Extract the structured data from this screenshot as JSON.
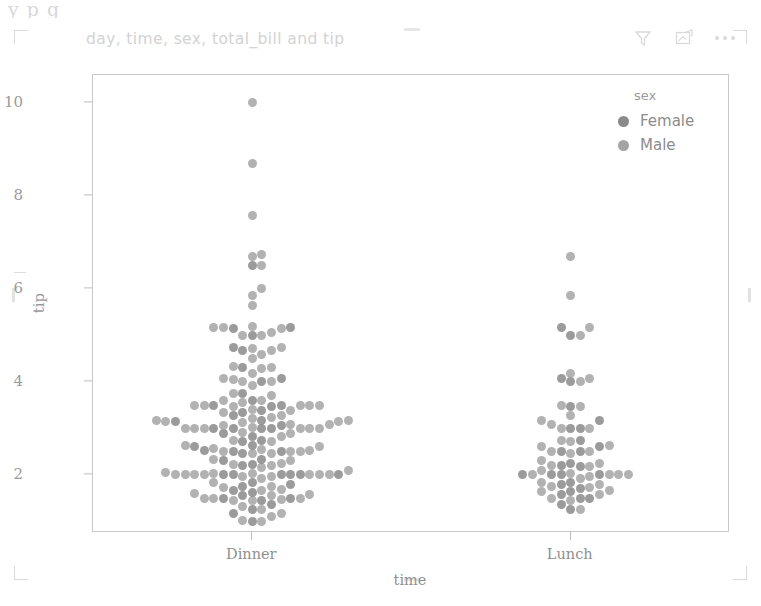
{
  "window": {
    "ghost_top_text": "y                    p      g",
    "background": "#ffffff"
  },
  "header": {
    "title": "day, time, sex, total_bill and tip",
    "title_color": "#d3d3d3",
    "toolbar": [
      {
        "name": "filter-icon",
        "label": "Filters"
      },
      {
        "name": "focus-mode-icon",
        "label": "Focus mode"
      },
      {
        "name": "more-options-icon",
        "label": "More options"
      }
    ]
  },
  "legend": {
    "title": "sex",
    "position": "top-right",
    "items": [
      {
        "label": "Female",
        "color": "#8a8a8a"
      },
      {
        "label": "Male",
        "color": "#a4a4a4"
      }
    ]
  },
  "chart_data": {
    "type": "scatter",
    "subtype": "swarmplot",
    "title": "day, time, sex, total_bill and tip",
    "xlabel": "time",
    "ylabel": "tip",
    "categories": [
      "Dinner",
      "Lunch"
    ],
    "yticks": [
      2,
      4,
      6,
      8,
      10
    ],
    "ylim": [
      0.75,
      10.6
    ],
    "grid": false,
    "legend_title": "sex",
    "legend_position": "upper right",
    "marker_size": 9,
    "colors": {
      "Female": "#8a8a8a",
      "Male": "#a4a4a4",
      "axis": "#c9c9c9",
      "text": "#9a9a9a"
    },
    "series": [
      {
        "name": "Female",
        "color": "#8a8a8a",
        "points": {
          "Dinner": [
            1.0,
            1.17,
            1.25,
            1.36,
            1.45,
            1.5,
            1.5,
            1.56,
            1.63,
            1.67,
            1.75,
            1.8,
            1.83,
            2.0,
            2.0,
            2.0,
            2.0,
            2.0,
            2.01,
            2.2,
            2.23,
            2.31,
            2.34,
            2.47,
            2.5,
            2.5,
            2.52,
            2.6,
            2.64,
            2.72,
            2.74,
            2.83,
            2.88,
            2.99,
            3.0,
            3.0,
            3.0,
            3.07,
            3.14,
            3.18,
            3.27,
            3.35,
            3.39,
            3.48,
            3.5,
            3.5,
            3.6,
            3.76,
            4.0,
            4.08,
            4.3,
            4.67,
            4.73,
            5.0,
            5.14,
            5.17,
            6.5
          ],
          "Lunch": [
            1.25,
            1.36,
            1.5,
            1.5,
            1.58,
            1.64,
            1.71,
            1.8,
            1.83,
            2.0,
            2.0,
            2.0,
            2.01,
            2.18,
            2.2,
            2.24,
            2.5,
            2.5,
            2.61,
            2.75,
            3.0,
            3.0,
            3.18,
            3.48,
            4.0,
            4.08,
            5.0,
            5.16
          ]
        }
      },
      {
        "name": "Male",
        "color": "#a4a4a4",
        "points": {
          "Dinner": [
            1.0,
            1.01,
            1.1,
            1.17,
            1.25,
            1.32,
            1.44,
            1.45,
            1.47,
            1.5,
            1.5,
            1.5,
            1.56,
            1.58,
            1.61,
            1.66,
            1.68,
            1.73,
            1.76,
            1.83,
            1.92,
            1.96,
            1.97,
            2.0,
            2.0,
            2.0,
            2.0,
            2.0,
            2.0,
            2.0,
            2.02,
            2.03,
            2.05,
            2.09,
            2.15,
            2.2,
            2.23,
            2.24,
            2.31,
            2.34,
            2.45,
            2.47,
            2.5,
            2.5,
            2.5,
            2.52,
            2.54,
            2.56,
            2.6,
            2.64,
            2.72,
            2.74,
            2.83,
            2.88,
            2.92,
            3.0,
            3.0,
            3.0,
            3.0,
            3.0,
            3.0,
            3.02,
            3.07,
            3.08,
            3.09,
            3.12,
            3.14,
            3.15,
            3.16,
            3.18,
            3.21,
            3.23,
            3.27,
            3.35,
            3.39,
            3.41,
            3.48,
            3.5,
            3.5,
            3.5,
            3.5,
            3.5,
            3.55,
            3.6,
            3.61,
            3.71,
            3.76,
            3.92,
            4.0,
            4.0,
            4.06,
            4.08,
            4.19,
            4.29,
            4.3,
            4.34,
            4.5,
            4.58,
            4.67,
            4.71,
            4.73,
            5.0,
            5.0,
            5.07,
            5.14,
            5.16,
            5.17,
            5.2,
            5.65,
            5.85,
            6.0,
            6.5,
            6.7,
            6.73,
            7.58,
            8.7,
            10.0
          ],
          "Lunch": [
            1.25,
            1.44,
            1.5,
            1.58,
            1.64,
            1.67,
            1.73,
            1.76,
            1.8,
            1.83,
            1.92,
            1.97,
            2.0,
            2.0,
            2.0,
            2.01,
            2.03,
            2.09,
            2.18,
            2.2,
            2.24,
            2.31,
            2.47,
            2.5,
            2.5,
            2.61,
            2.64,
            2.72,
            2.75,
            3.0,
            3.0,
            3.08,
            3.18,
            3.27,
            3.48,
            3.5,
            4.0,
            4.08,
            4.19,
            5.0,
            5.16,
            5.85,
            6.7
          ]
        }
      }
    ]
  }
}
